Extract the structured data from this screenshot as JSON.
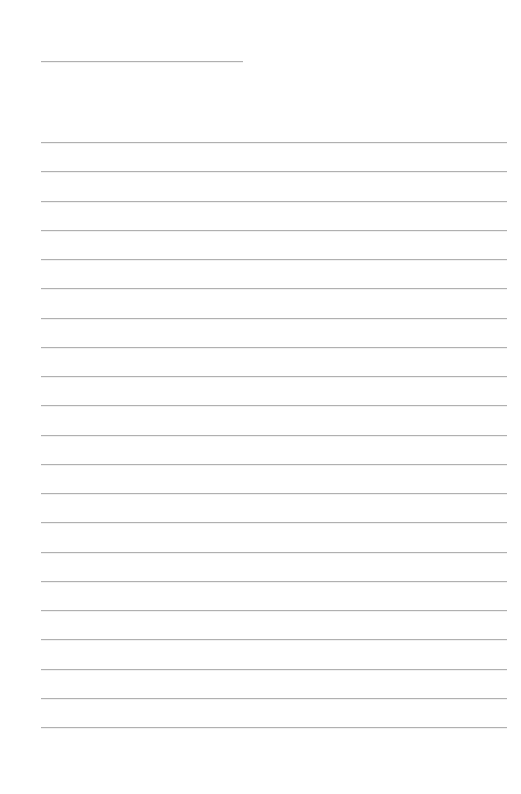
{
  "page": {
    "type": "lined-paper",
    "background_color": "#ffffff",
    "line_color": "#b0b0b0"
  },
  "header_line": {
    "x_start": 41,
    "x_end": 243,
    "y": 61
  },
  "ruled_lines": {
    "count": 21,
    "x_start": 41,
    "x_end": 507,
    "first_y": 142,
    "spacing": 29.25
  }
}
